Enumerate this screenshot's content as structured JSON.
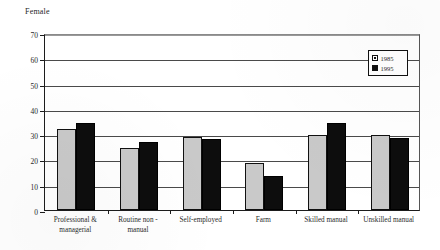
{
  "chart_data": {
    "type": "bar",
    "title": "Female",
    "xlabel": "",
    "ylabel": "",
    "ylim": [
      0,
      70
    ],
    "yticks": [
      0,
      10,
      20,
      30,
      40,
      50,
      60,
      70
    ],
    "grid": true,
    "legend_position": "top-right",
    "categories": [
      "Professional & managerial",
      "Routine non - manual",
      "Self-employed",
      "Farm",
      "Skilled manual",
      "Unskilled manual"
    ],
    "category_lines": [
      [
        "Professional &",
        "managerial"
      ],
      [
        "Routine non  -",
        "manual"
      ],
      [
        "Self-employed"
      ],
      [
        "Farm"
      ],
      [
        "Skilled manual"
      ],
      [
        "Unskilled manual"
      ]
    ],
    "series": [
      {
        "name": "1985",
        "color": "#c9c9c9",
        "values": [
          32,
          24.5,
          29,
          18.5,
          29.5,
          29.5
        ]
      },
      {
        "name": "1995",
        "color": "#0d0d0d",
        "values": [
          34.5,
          27,
          28,
          13.5,
          34.5,
          28.5
        ]
      }
    ]
  },
  "legend": {
    "items": [
      {
        "label": "1985"
      },
      {
        "label": "1995"
      }
    ]
  }
}
